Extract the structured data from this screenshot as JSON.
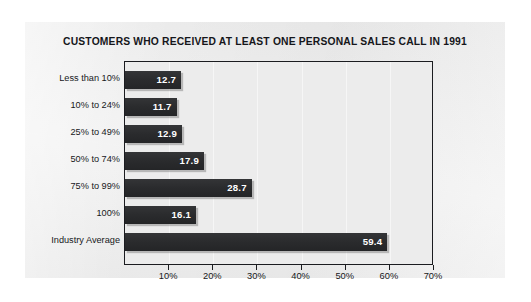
{
  "chart_data": {
    "type": "bar",
    "orientation": "horizontal",
    "title": "CUSTOMERS WHO RECEIVED AT LEAST ONE PERSONAL SALES CALL IN 1991",
    "xlabel": "",
    "ylabel": "",
    "categories": [
      "Less than 10%",
      "10% to 24%",
      "25% to 49%",
      "50% to 74%",
      "75% to 99%",
      "100%",
      "Industry Average"
    ],
    "values": [
      12.7,
      11.7,
      12.9,
      17.9,
      28.7,
      16.1,
      59.4
    ],
    "value_labels": [
      "12.7",
      "11.7",
      "12.9",
      "17.9",
      "28.7",
      "16.1",
      "59.4"
    ],
    "xlim": [
      0,
      70
    ],
    "xticks": [
      10,
      20,
      30,
      40,
      50,
      60,
      70
    ],
    "xtick_labels": [
      "10%",
      "20%",
      "30%",
      "40%",
      "50%",
      "60%",
      "70%"
    ],
    "grid": true,
    "legend": null,
    "colors": {
      "bar": "#2b2c2e",
      "plot_background": "#ececec",
      "card_background": "#ededed",
      "axis": "#1b1c20",
      "text": "#17181b",
      "value_text": "#ffffff",
      "gridline": "#f6f6f6"
    }
  }
}
